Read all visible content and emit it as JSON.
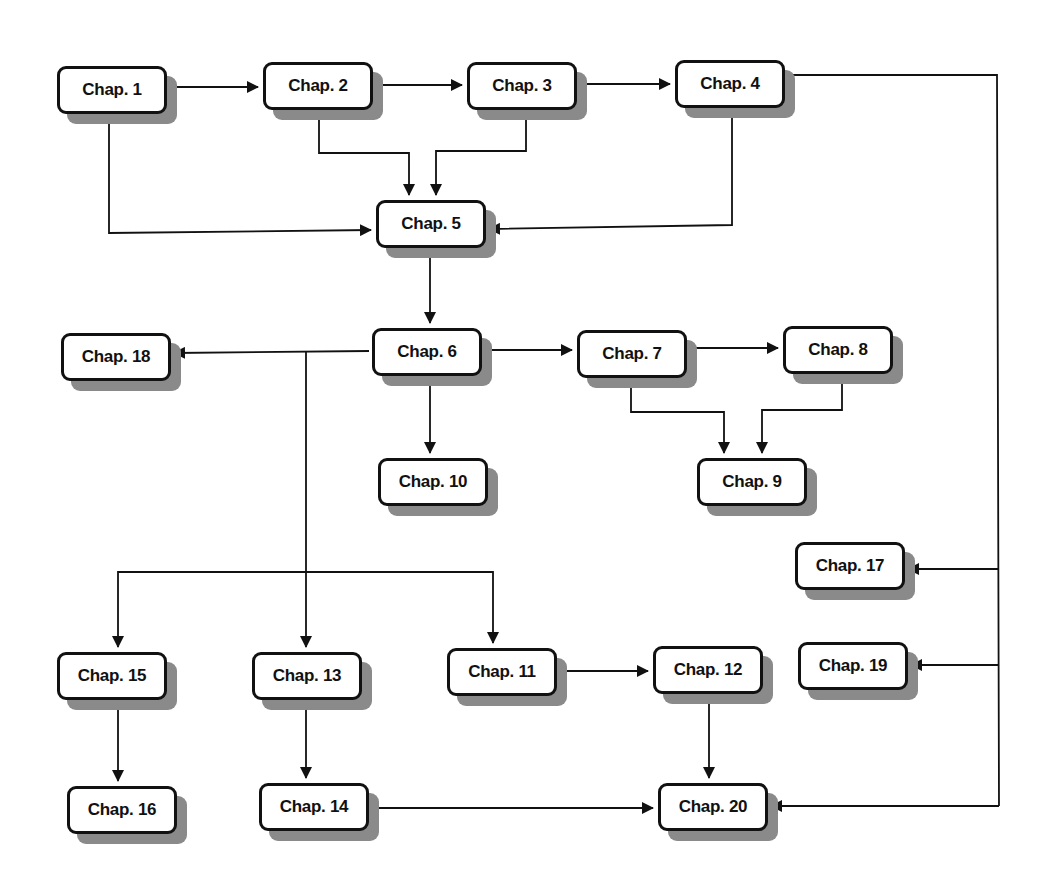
{
  "diagram": {
    "type": "flowchart",
    "colors": {
      "line": "#111111",
      "box_fill": "#ffffff",
      "shadow": "#8a8a8a"
    },
    "nodes": [
      {
        "id": "ch1",
        "label": "Chap. 1",
        "x": 57,
        "y": 66
      },
      {
        "id": "ch2",
        "label": "Chap. 2",
        "x": 263,
        "y": 62
      },
      {
        "id": "ch3",
        "label": "Chap. 3",
        "x": 467,
        "y": 62
      },
      {
        "id": "ch4",
        "label": "Chap. 4",
        "x": 675,
        "y": 60
      },
      {
        "id": "ch5",
        "label": "Chap. 5",
        "x": 376,
        "y": 200
      },
      {
        "id": "ch6",
        "label": "Chap. 6",
        "x": 372,
        "y": 328
      },
      {
        "id": "ch7",
        "label": "Chap. 7",
        "x": 577,
        "y": 330
      },
      {
        "id": "ch8",
        "label": "Chap. 8",
        "x": 783,
        "y": 326
      },
      {
        "id": "ch9",
        "label": "Chap. 9",
        "x": 697,
        "y": 458
      },
      {
        "id": "ch10",
        "label": "Chap. 10",
        "x": 378,
        "y": 458
      },
      {
        "id": "ch11",
        "label": "Chap. 11",
        "x": 447,
        "y": 648
      },
      {
        "id": "ch12",
        "label": "Chap. 12",
        "x": 653,
        "y": 646
      },
      {
        "id": "ch13",
        "label": "Chap. 13",
        "x": 252,
        "y": 652
      },
      {
        "id": "ch14",
        "label": "Chap. 14",
        "x": 259,
        "y": 783
      },
      {
        "id": "ch15",
        "label": "Chap. 15",
        "x": 57,
        "y": 652
      },
      {
        "id": "ch16",
        "label": "Chap. 16",
        "x": 67,
        "y": 786
      },
      {
        "id": "ch17",
        "label": "Chap. 17",
        "x": 795,
        "y": 542
      },
      {
        "id": "ch18",
        "label": "Chap. 18",
        "x": 61,
        "y": 333
      },
      {
        "id": "ch19",
        "label": "Chap. 19",
        "x": 798,
        "y": 642
      },
      {
        "id": "ch20",
        "label": "Chap. 20",
        "x": 658,
        "y": 783
      }
    ],
    "edges": [
      {
        "from": "ch1",
        "to": "ch2"
      },
      {
        "from": "ch2",
        "to": "ch3"
      },
      {
        "from": "ch3",
        "to": "ch4"
      },
      {
        "from": "ch1",
        "to": "ch5"
      },
      {
        "from": "ch2",
        "to": "ch5"
      },
      {
        "from": "ch3",
        "to": "ch5"
      },
      {
        "from": "ch4",
        "to": "ch5"
      },
      {
        "from": "ch5",
        "to": "ch6"
      },
      {
        "from": "ch6",
        "to": "ch18"
      },
      {
        "from": "ch6",
        "to": "ch7"
      },
      {
        "from": "ch7",
        "to": "ch8"
      },
      {
        "from": "ch7",
        "to": "ch9"
      },
      {
        "from": "ch8",
        "to": "ch9"
      },
      {
        "from": "ch6",
        "to": "ch10"
      },
      {
        "from": "ch6",
        "to": "ch15"
      },
      {
        "from": "ch6",
        "to": "ch13"
      },
      {
        "from": "ch6",
        "to": "ch11"
      },
      {
        "from": "ch15",
        "to": "ch16"
      },
      {
        "from": "ch13",
        "to": "ch14"
      },
      {
        "from": "ch11",
        "to": "ch12"
      },
      {
        "from": "ch12",
        "to": "ch20"
      },
      {
        "from": "ch14",
        "to": "ch20"
      },
      {
        "from": "ch4",
        "to": "ch17"
      },
      {
        "from": "ch4",
        "to": "ch19"
      },
      {
        "from": "ch4",
        "to": "ch20"
      }
    ]
  }
}
